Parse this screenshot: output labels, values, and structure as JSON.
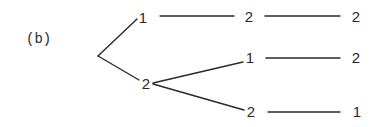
{
  "figure": {
    "caption": "(b)",
    "tree": {
      "root": {
        "x": 98,
        "y": 56
      },
      "nodes": [
        {
          "id": "n1",
          "label": "1",
          "x": 143,
          "y": 17,
          "level": 1
        },
        {
          "id": "n2",
          "label": "2",
          "x": 146,
          "y": 83,
          "level": 1
        },
        {
          "id": "n11",
          "label": "2",
          "x": 249,
          "y": 16,
          "level": 2
        },
        {
          "id": "n21",
          "label": "1",
          "x": 250,
          "y": 57,
          "level": 2
        },
        {
          "id": "n22",
          "label": "2",
          "x": 251,
          "y": 111,
          "level": 2
        },
        {
          "id": "n111",
          "label": "2",
          "x": 356,
          "y": 16,
          "level": 3
        },
        {
          "id": "n211",
          "label": "2",
          "x": 356,
          "y": 57,
          "level": 3
        },
        {
          "id": "n221",
          "label": "1",
          "x": 357,
          "y": 111,
          "level": 3
        }
      ],
      "edges": [
        {
          "from": "root",
          "to": "n1",
          "x1": 98,
          "y1": 56,
          "x2": 137,
          "y2": 19
        },
        {
          "from": "root",
          "to": "n2",
          "x1": 98,
          "y1": 56,
          "x2": 139,
          "y2": 80
        },
        {
          "from": "n1",
          "to": "n11",
          "x1": 160,
          "y1": 16,
          "x2": 234,
          "y2": 16
        },
        {
          "from": "n2",
          "to": "n21",
          "x1": 153,
          "y1": 83,
          "x2": 243,
          "y2": 62
        },
        {
          "from": "n2",
          "to": "n22",
          "x1": 153,
          "y1": 84,
          "x2": 244,
          "y2": 110
        },
        {
          "from": "n11",
          "to": "n111",
          "x1": 265,
          "y1": 16,
          "x2": 340,
          "y2": 16
        },
        {
          "from": "n21",
          "to": "n211",
          "x1": 266,
          "y1": 58,
          "x2": 340,
          "y2": 58
        },
        {
          "from": "n22",
          "to": "n221",
          "x1": 268,
          "y1": 112,
          "x2": 340,
          "y2": 112
        }
      ]
    }
  }
}
